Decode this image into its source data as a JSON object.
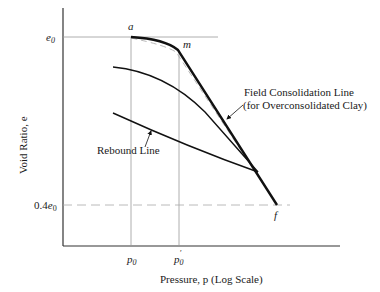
{
  "diagram": {
    "axes": {
      "y_label": "Void Ratio, e",
      "x_label": "Pressure, p (Log Scale)",
      "y_ticks": [
        {
          "label": "e0",
          "sub": "0",
          "base": "e"
        },
        {
          "label": "0.4e0",
          "prefix": "0.4",
          "base": "e",
          "sub": "0"
        }
      ],
      "x_ticks": [
        {
          "label": "p0",
          "base": "p",
          "sub": "0"
        },
        {
          "label": "p0'",
          "base": "p",
          "sub": "0",
          "prime": "′"
        }
      ]
    },
    "points": {
      "a": "a",
      "m": "m",
      "f": "f"
    },
    "annotations": {
      "field_line_1": "Field Consolidation Line",
      "field_line_2": "(for Overconsolidated Clay)",
      "rebound": "Rebound Line"
    },
    "colors": {
      "line": "#111111",
      "guide": "#9a9a9a",
      "dashed": "#a8a8a8"
    }
  }
}
